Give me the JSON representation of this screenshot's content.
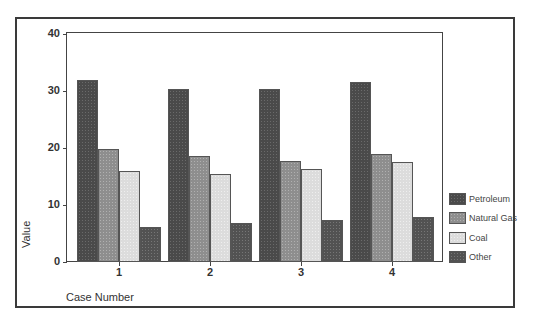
{
  "chart_data": {
    "type": "bar",
    "title": "",
    "xlabel": "Case Number",
    "ylabel": "Value",
    "categories": [
      "1",
      "2",
      "3",
      "4"
    ],
    "series": [
      {
        "name": "Petroleum",
        "values": [
          31.9,
          30.4,
          30.4,
          31.6
        ],
        "color": "#4a4a4a"
      },
      {
        "name": "Natural Gas",
        "values": [
          19.8,
          18.6,
          17.7,
          19.0
        ],
        "color": "#8e8e8e"
      },
      {
        "name": "Coal",
        "values": [
          16.0,
          15.4,
          16.3,
          17.5
        ],
        "color": "#dcdcdc"
      },
      {
        "name": "Other",
        "values": [
          6.1,
          6.8,
          7.4,
          7.9
        ],
        "color": "#525252"
      }
    ],
    "ylim": [
      0,
      40
    ],
    "yticks": [
      "0",
      "10",
      "20",
      "30",
      "40"
    ],
    "grid": false,
    "legend_position": "right"
  }
}
